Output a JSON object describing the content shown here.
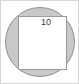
{
  "figure": {
    "name": "square-inscribed-in-circle",
    "frame": {
      "width": 79,
      "height": 84,
      "border_color": "#d6d6d6",
      "background_color": "#ffffff"
    },
    "circle": {
      "center_x": 39,
      "center_y": 41,
      "radius": 34.5,
      "fill_color": "#c9c9c9",
      "stroke_color": "#8f8f8f",
      "stroke_width": 1
    },
    "square": {
      "x": 17.5,
      "y": 15.5,
      "width": 48,
      "height": 53,
      "fill_color": "#ffffff",
      "stroke_color": "#9a9a9a",
      "stroke_width": 1
    },
    "labels": {
      "side_length": {
        "text": "10",
        "x": 45,
        "y": 22,
        "color": "#3b3b3b",
        "font_size": 9
      }
    }
  }
}
